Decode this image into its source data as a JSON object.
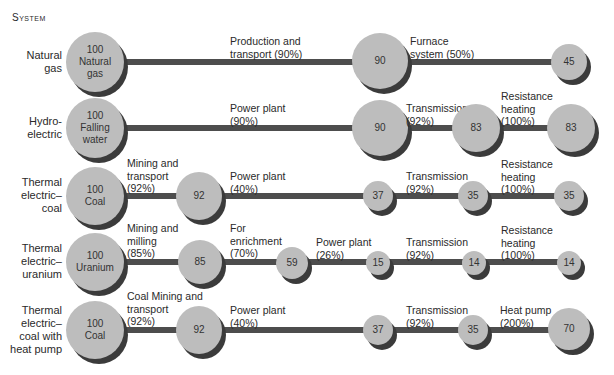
{
  "header": "System",
  "rows": [
    {
      "label": "Natural gas",
      "nodes": [
        {
          "value": "100",
          "text": "Natural gas"
        },
        {
          "value": "90"
        },
        {
          "value": "45"
        }
      ],
      "steps": [
        "Production and transport (90%)",
        "Furnace system (50%)"
      ]
    },
    {
      "label": "Hydro-electric",
      "nodes": [
        {
          "value": "100",
          "text": "Falling water"
        },
        {
          "value": "90"
        },
        {
          "value": "83"
        },
        {
          "value": "83"
        }
      ],
      "steps": [
        "Power plant (90%)",
        "Transmission (92%)",
        "Resistance heating (100%)"
      ]
    },
    {
      "label": "Thermal electric–coal",
      "nodes": [
        {
          "value": "100",
          "text": "Coal"
        },
        {
          "value": "92"
        },
        {
          "value": "37"
        },
        {
          "value": "35"
        },
        {
          "value": "35"
        }
      ],
      "steps": [
        "Mining and transport (92%)",
        "Power plant (40%)",
        "Transmission (92%)",
        "Resistance heating (100%)"
      ]
    },
    {
      "label": "Thermal electric–uranium",
      "nodes": [
        {
          "value": "100",
          "text": "Uranium"
        },
        {
          "value": "85"
        },
        {
          "value": "59"
        },
        {
          "value": "15"
        },
        {
          "value": "14"
        },
        {
          "value": "14"
        }
      ],
      "steps": [
        "Mining and milling (85%)",
        "For enrichment (70%)",
        "Power plant (26%)",
        "Transmission (92%)",
        "Resistance heating (100%)"
      ]
    },
    {
      "label": "Thermal electric–coal with heat pump",
      "nodes": [
        {
          "value": "100",
          "text": "Coal"
        },
        {
          "value": "92"
        },
        {
          "value": "37"
        },
        {
          "value": "35"
        },
        {
          "value": "70"
        }
      ],
      "steps": [
        "Coal Mining and transport (92%)",
        "Power plant (40%)",
        "Transmission (92%)",
        "Heat pump (200%)"
      ]
    }
  ],
  "text": {
    "r0_label_a": "Natural",
    "r0_label_b": "gas",
    "r1_label_a": "Hydro-",
    "r1_label_b": "electric",
    "r2_label_a": "Thermal",
    "r2_label_b": "electric–",
    "r2_label_c": "coal",
    "r3_label_a": "Thermal",
    "r3_label_b": "electric–",
    "r3_label_c": "uranium",
    "r4_label_a": "Thermal",
    "r4_label_b": "electric–",
    "r4_label_c": "coal with",
    "r4_label_d": "heat pump",
    "r0_n0_a": "100",
    "r0_n0_b": "Natural",
    "r0_n0_c": "gas",
    "r0_n1": "90",
    "r0_n2": "45",
    "r0_s0_a": "Production and",
    "r0_s0_b": "transport (90%)",
    "r0_s1_a": "Furnace",
    "r0_s1_b": "system (50%)",
    "r1_n0_a": "100",
    "r1_n0_b": "Falling",
    "r1_n0_c": "water",
    "r1_n1": "90",
    "r1_n2": "83",
    "r1_n3": "83",
    "r1_s0_a": "Power plant",
    "r1_s0_b": "(90%)",
    "r1_s1_a": "Transmission",
    "r1_s1_b": "(92%)",
    "r1_s2_a": "Resistance",
    "r1_s2_b": "heating",
    "r1_s2_c": "(100%)",
    "r2_n0_a": "100",
    "r2_n0_b": "Coal",
    "r2_n1": "92",
    "r2_n2": "37",
    "r2_n3": "35",
    "r2_n4": "35",
    "r2_s0_a": "Mining and",
    "r2_s0_b": "transport",
    "r2_s0_c": "(92%)",
    "r2_s1_a": "Power plant",
    "r2_s1_b": "(40%)",
    "r2_s2_a": "Transmission",
    "r2_s2_b": "(92%)",
    "r2_s3_a": "Resistance",
    "r2_s3_b": "heating",
    "r2_s3_c": "(100%)",
    "r3_n0_a": "100",
    "r3_n0_b": "Uranium",
    "r3_n1": "85",
    "r3_n2": "59",
    "r3_n3": "15",
    "r3_n4": "14",
    "r3_n5": "14",
    "r3_s0_a": "Mining and",
    "r3_s0_b": "milling",
    "r3_s0_c": "(85%)",
    "r3_s1_a": "For",
    "r3_s1_b": "enrichment",
    "r3_s1_c": "(70%)",
    "r3_s2_a": "Power plant",
    "r3_s2_b": "(26%)",
    "r3_s3_a": "Transmission",
    "r3_s3_b": "(92%)",
    "r3_s4_a": "Resistance",
    "r3_s4_b": "heating",
    "r3_s4_c": "(100%)",
    "r4_n0_a": "100",
    "r4_n0_b": "Coal",
    "r4_n1": "92",
    "r4_n2": "37",
    "r4_n3": "35",
    "r4_n4": "70",
    "r4_s0_a": "Coal Mining and",
    "r4_s0_b": "transport",
    "r4_s0_c": "(92%)",
    "r4_s1_a": "Power plant",
    "r4_s1_b": "(40%)",
    "r4_s2_a": "Transmission",
    "r4_s2_b": "(92%)",
    "r4_s3_a": "Heat pump",
    "r4_s3_b": "(200%)"
  },
  "colors": {
    "node_fill": "#bdbdbd",
    "node_shadow": "#3b3b3b",
    "bar": "#4d4d4d"
  }
}
